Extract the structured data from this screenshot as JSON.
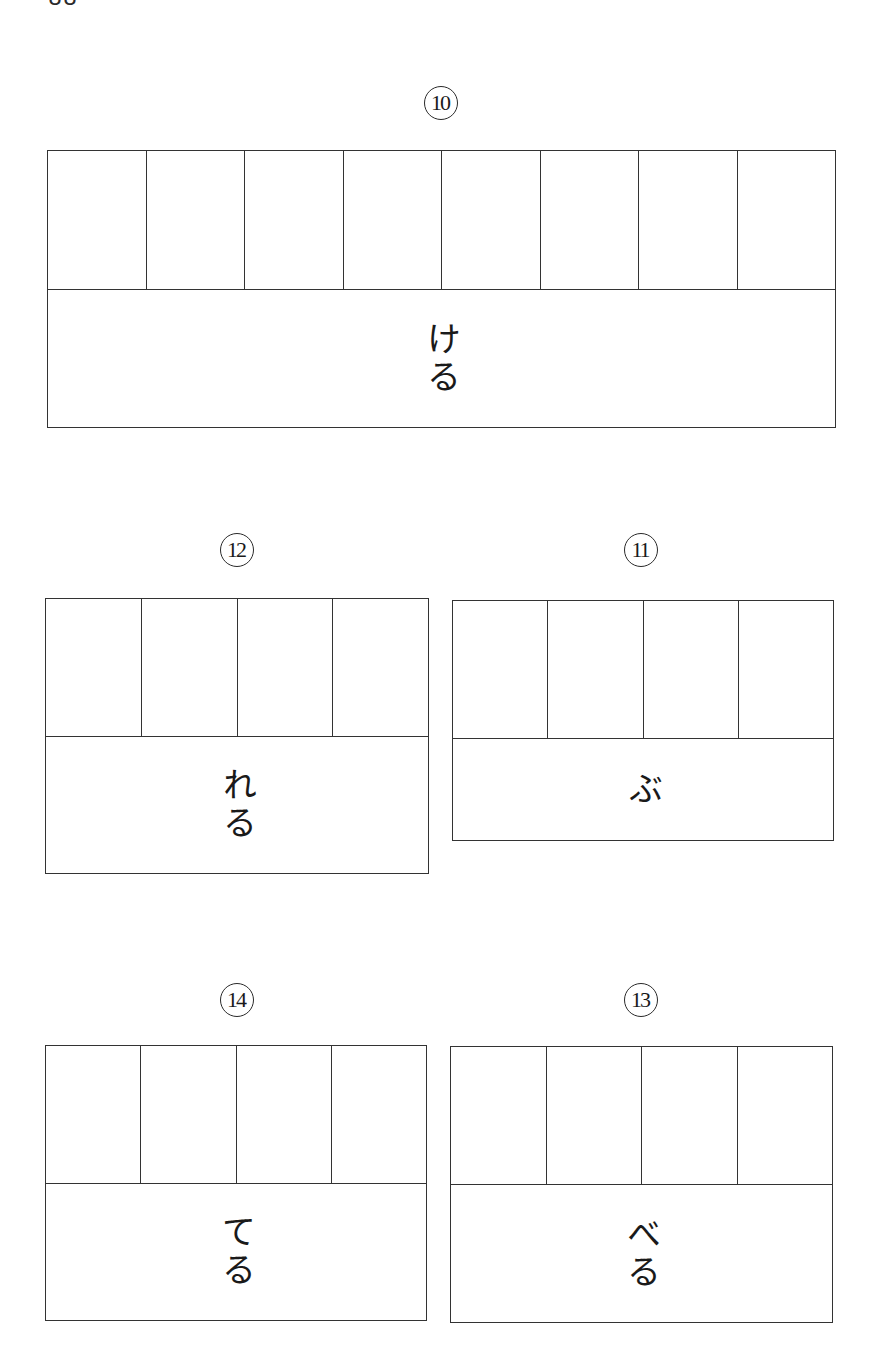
{
  "page": {
    "page_number": "88"
  },
  "questions": [
    {
      "id": "q10",
      "number_label": "10",
      "cell_count": 8,
      "okurigana": "ける"
    },
    {
      "id": "q12",
      "number_label": "12",
      "cell_count": 4,
      "okurigana": "れる"
    },
    {
      "id": "q11",
      "number_label": "11",
      "cell_count": 4,
      "okurigana": "ぶ"
    },
    {
      "id": "q14",
      "number_label": "14",
      "cell_count": 4,
      "okurigana": "てる"
    },
    {
      "id": "q13",
      "number_label": "13",
      "cell_count": 4,
      "okurigana": "べる"
    }
  ],
  "colors": {
    "ink": "#1a1a1a",
    "line": "#333333",
    "background": "#ffffff"
  }
}
